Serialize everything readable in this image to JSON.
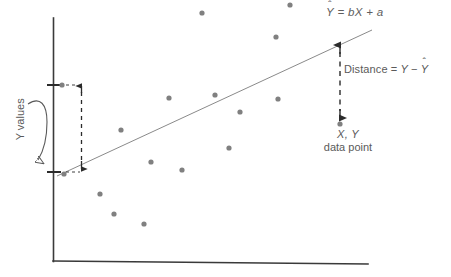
{
  "figure": {
    "background_color": "#ffffff"
  },
  "labels": {
    "regression_equation": "Ŷ = bX + a",
    "regression_equation_parts": {
      "lhs": "Y",
      "hat": "ˆ",
      "rhs": " = bX + a"
    },
    "distance": "Distance = Y − Ŷ",
    "distance_parts": {
      "word": "Distance",
      "equals": " = ",
      "y": "Y",
      "minus": " − ",
      "yhat": "Y",
      "hat": "ˆ"
    },
    "data_point_coords": "X, Y",
    "data_point_caption": "data point",
    "y_values": "Y values"
  },
  "chart_data": {
    "type": "scatter",
    "title": "",
    "xlabel": "",
    "ylabel": "Y values",
    "grid": false,
    "legend": false,
    "axis_color": "#3a3a3a",
    "point_color": "#808080",
    "line_color": "#8a8a8a",
    "annotation_color": "#5a5a5a",
    "axes": {
      "y_axis": {
        "x": 53,
        "y_top": 18,
        "y_bottom": 261
      },
      "x_axis": {
        "y_left": 261,
        "y_right": 264,
        "x_left": 53,
        "x_right": 368
      }
    },
    "regression_line": {
      "label": "Ŷ = bX + a",
      "x1": 57,
      "y1": 176,
      "x2": 372,
      "y2": 30
    },
    "points": [
      {
        "x": 62,
        "y": 85
      },
      {
        "x": 64,
        "y": 174
      },
      {
        "x": 100,
        "y": 194
      },
      {
        "x": 114,
        "y": 214
      },
      {
        "x": 121,
        "y": 130
      },
      {
        "x": 144,
        "y": 224
      },
      {
        "x": 151,
        "y": 162
      },
      {
        "x": 169,
        "y": 98
      },
      {
        "x": 182,
        "y": 170
      },
      {
        "x": 202,
        "y": 13
      },
      {
        "x": 215,
        "y": 95
      },
      {
        "x": 229,
        "y": 148
      },
      {
        "x": 240,
        "y": 112
      },
      {
        "x": 276,
        "y": 37
      },
      {
        "x": 278,
        "y": 99
      },
      {
        "x": 290,
        "y": 5
      },
      {
        "x": 340,
        "y": 124
      }
    ],
    "residual_annotation": {
      "label": "Distance = Y − Ŷ",
      "x": 340,
      "y_line": 45,
      "y_point": 118,
      "style": "dashed-double-arrow"
    },
    "y_range_annotation": {
      "label": "Y values",
      "x": 82,
      "y_top": 85,
      "y_bottom": 172,
      "style": "dashed-double-arrow",
      "ticks": [
        {
          "x": 53,
          "y": 85
        },
        {
          "x": 53,
          "y": 172
        }
      ]
    }
  }
}
